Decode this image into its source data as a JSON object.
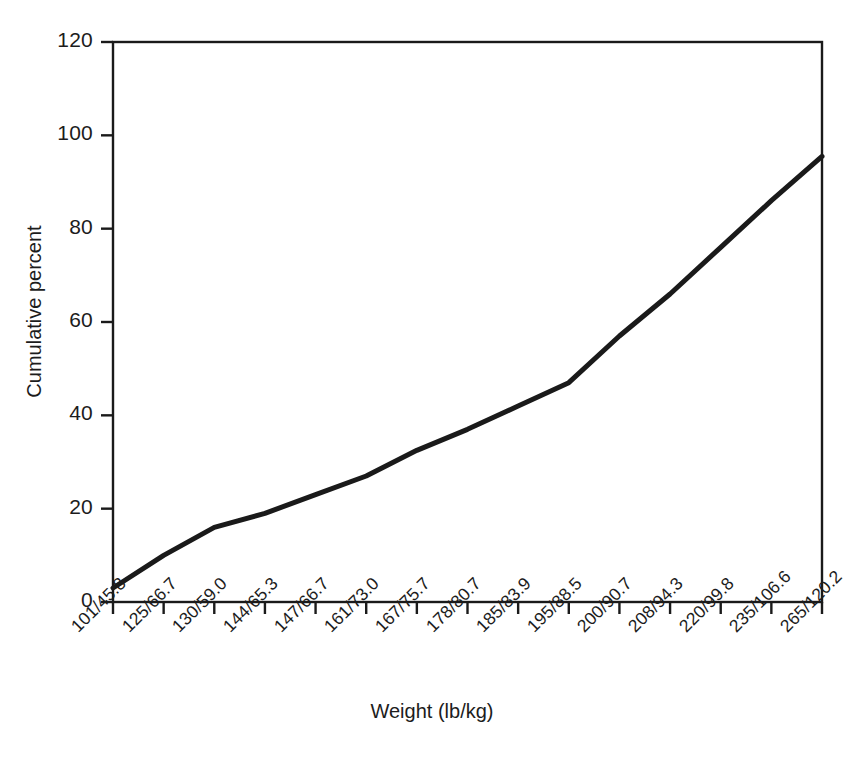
{
  "chart_data": {
    "type": "line",
    "title": "",
    "subtitle": "",
    "xlabel": "Weight (lb/kg)",
    "ylabel": "Cumulative percent",
    "categories": [
      "101/45.8",
      "125/66.7",
      "130/59.0",
      "144/65.3",
      "147/66.7",
      "161/73.0",
      "167/75.7",
      "178/80.7",
      "185/83.9",
      "195/88.5",
      "200/90.7",
      "208/94.3",
      "220/99.8",
      "235/106.6",
      "265/120.2"
    ],
    "values": [
      3,
      10,
      16,
      19,
      23,
      27,
      32.5,
      37,
      42,
      47,
      57,
      66,
      76,
      86,
      95.5
    ],
    "series": [
      {
        "name": "Cumulative percent",
        "values": [
          3,
          10,
          16,
          19,
          23,
          27,
          32.5,
          37,
          42,
          47,
          57,
          66,
          76,
          86,
          95.5
        ]
      }
    ],
    "ylim": [
      0,
      120
    ],
    "yticks": [
      0,
      20,
      40,
      60,
      80,
      100,
      120
    ],
    "ytick_labels": [
      "0",
      "20",
      "40",
      "60",
      "80",
      "100",
      "120"
    ],
    "xtick_rotation": -45,
    "grid": false,
    "legend": false,
    "legend_position": "none",
    "line_color": "#1a1a1a",
    "line_width": 5,
    "frame_color": "#1a1a1a",
    "background": "#ffffff"
  },
  "axis": {
    "y_title": "Cumulative percent",
    "x_title": "Weight (lb/kg)"
  }
}
